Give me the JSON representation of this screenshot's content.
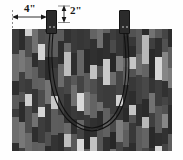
{
  "annotations": {
    "width_label": "4\"",
    "tab_label": "2\""
  },
  "colors": {
    "background": "#ffffff",
    "ink": "#1a1a1a",
    "tab_fill": "#2b2b2b",
    "handle": "#111111",
    "fabric_base": "#4a4a4a"
  },
  "icons": {
    "arrow_horizontal": "double-headed-arrow",
    "arrow_vertical": "double-headed-arrow"
  },
  "chart_data": {
    "type": "diagram",
    "parts": [
      {
        "name": "bag-body",
        "x": 12,
        "y": 29,
        "w": 160,
        "h": 122
      },
      {
        "name": "strap-tab-left",
        "x": 46,
        "y": 10,
        "w": 11,
        "h": 24
      },
      {
        "name": "strap-tab-right",
        "x": 119,
        "y": 10,
        "w": 11,
        "h": 24
      },
      {
        "name": "handle-strap",
        "type": "u-curve"
      }
    ],
    "dimensions": [
      {
        "label": "4\"",
        "orientation": "horizontal",
        "from_x": 12,
        "to_x": 46,
        "y": 17
      },
      {
        "label": "2\"",
        "orientation": "vertical",
        "x": 64,
        "from_y": 6,
        "to_y": 22
      }
    ],
    "fabric_strips": [
      {
        "x": 0,
        "w": 7,
        "shades": [
          "#3b3b3b",
          "#6e6e6e",
          "#2f2f2f",
          "#5a5a5a"
        ]
      },
      {
        "x": 7,
        "w": 6,
        "shades": [
          "#555555",
          "#2c2c2c",
          "#787878",
          "#3f3f3f"
        ]
      },
      {
        "x": 13,
        "w": 7,
        "shades": [
          "#6a6a6a",
          "#3a3a3a",
          "#cfcfcf",
          "#4d4d4d"
        ]
      },
      {
        "x": 20,
        "w": 6,
        "shades": [
          "#2e2e2e",
          "#5f5f5f",
          "#353535",
          "#717171"
        ]
      },
      {
        "x": 26,
        "w": 7,
        "shades": [
          "#4c4c4c",
          "#d4d4d4",
          "#3d3d3d",
          "#616161"
        ]
      },
      {
        "x": 33,
        "w": 6,
        "shades": [
          "#747474",
          "#353535",
          "#505050",
          "#2b2b2b"
        ]
      },
      {
        "x": 39,
        "w": 7,
        "shades": [
          "#3c3c3c",
          "#c8c8c8",
          "#5d5d5d",
          "#333333"
        ]
      },
      {
        "x": 46,
        "w": 6,
        "shades": [
          "#5c5c5c",
          "#2d2d2d",
          "#6b6b6b",
          "#414141"
        ]
      },
      {
        "x": 52,
        "w": 7,
        "shades": [
          "#323232",
          "#686868",
          "#bdbdbd",
          "#474747"
        ]
      },
      {
        "x": 59,
        "w": 6,
        "shades": [
          "#6f6f6f",
          "#3a3a3a",
          "#2e2e2e",
          "#585858"
        ]
      },
      {
        "x": 65,
        "w": 7,
        "shades": [
          "#434343",
          "#d8d8d8",
          "#363636",
          "#656565"
        ]
      },
      {
        "x": 72,
        "w": 6,
        "shades": [
          "#2a2a2a",
          "#5b5b5b",
          "#7a7a7a",
          "#393939"
        ]
      },
      {
        "x": 78,
        "w": 7,
        "shades": [
          "#636363",
          "#303030",
          "#c2c2c2",
          "#4f4f4f"
        ]
      },
      {
        "x": 85,
        "w": 6,
        "shades": [
          "#3e3e3e",
          "#707070",
          "#2c2c2c",
          "#565656"
        ]
      },
      {
        "x": 91,
        "w": 7,
        "shades": [
          "#cacaca",
          "#3b3b3b",
          "#606060",
          "#2f2f2f"
        ]
      },
      {
        "x": 98,
        "w": 6,
        "shades": [
          "#4a4a4a",
          "#272727",
          "#6c6c6c",
          "#3d3d3d"
        ]
      },
      {
        "x": 104,
        "w": 7,
        "shades": [
          "#353535",
          "#7d7d7d",
          "#454545",
          "#d0d0d0"
        ]
      },
      {
        "x": 111,
        "w": 6,
        "shades": [
          "#5e5e5e",
          "#313131",
          "#2a2a2a",
          "#676767"
        ]
      },
      {
        "x": 117,
        "w": 7,
        "shades": [
          "#2d2d2d",
          "#c5c5c5",
          "#525252",
          "#383838"
        ]
      },
      {
        "x": 124,
        "w": 6,
        "shades": [
          "#6d6d6d",
          "#404040",
          "#303030",
          "#5a5a5a"
        ]
      },
      {
        "x": 130,
        "w": 7,
        "shades": [
          "#484848",
          "#2b2b2b",
          "#b8b8b8",
          "#646464"
        ]
      },
      {
        "x": 137,
        "w": 6,
        "shades": [
          "#343434",
          "#727272",
          "#3f3f3f",
          "#292929"
        ]
      },
      {
        "x": 143,
        "w": 7,
        "shades": [
          "#d6d6d6",
          "#3d3d3d",
          "#595959",
          "#2e2e2e"
        ]
      },
      {
        "x": 150,
        "w": 6,
        "shades": [
          "#515151",
          "#868686",
          "#313131",
          "#454545"
        ]
      },
      {
        "x": 156,
        "w": 4,
        "shades": [
          "#2c2c2c",
          "#5d5d5d",
          "#7b7b7b",
          "#3a3a3a"
        ]
      }
    ]
  }
}
